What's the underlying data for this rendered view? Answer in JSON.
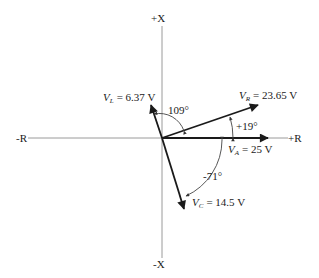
{
  "axes": {
    "pos_x": "+X",
    "neg_x": "-X",
    "pos_r": "+R",
    "neg_r": "-R"
  },
  "phasors": {
    "VL": {
      "symbol": "V",
      "sub": "L",
      "value": "= 6.37 V",
      "angle_deg": 109
    },
    "VR": {
      "symbol": "V",
      "sub": "R",
      "value": "= 23.65 V",
      "angle_deg": 19
    },
    "VA": {
      "symbol": "V",
      "sub": "A",
      "value": "= 25 V",
      "angle_deg": 0
    },
    "VC": {
      "symbol": "V",
      "sub": "C",
      "value": "= 14.5 V",
      "angle_deg": -71
    }
  },
  "angles": {
    "a109": "109°",
    "a19": "+19°",
    "a71": "-71°"
  },
  "colors": {
    "axis": "#9a9a9a",
    "vector": "#1a1a1a",
    "arc": "#555555"
  }
}
